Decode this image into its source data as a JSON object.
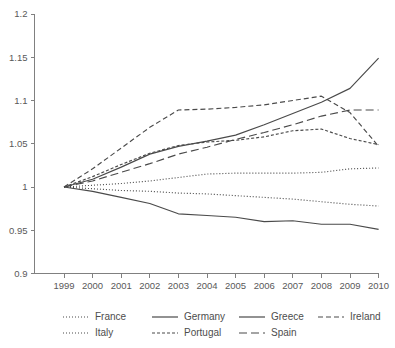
{
  "chart_data": {
    "type": "line",
    "title": "",
    "xlabel": "",
    "ylabel": "",
    "grid": false,
    "legend_position": "bottom",
    "x": [
      1999,
      2000,
      2001,
      2002,
      2003,
      2004,
      2005,
      2006,
      2007,
      2008,
      2009,
      2010
    ],
    "xtick_labels": [
      "1999",
      "2000",
      "2001",
      "2002",
      "2003",
      "2004",
      "2005",
      "2006",
      "2007",
      "2008",
      "2009",
      "2010"
    ],
    "ytick_labels": [
      "0.9",
      "0.95",
      "1",
      "1.05",
      "1.1",
      "1.15",
      "1.2"
    ],
    "ytick_values": [
      0.9,
      0.95,
      1.0,
      1.05,
      1.1,
      1.15,
      1.2
    ],
    "xlim": [
      1999,
      2010
    ],
    "ylim": [
      0.9,
      1.2
    ],
    "series": [
      {
        "name": "France",
        "style": "dotted",
        "dash": "1,2",
        "width": 1.1,
        "values": [
          1.0,
          1.002,
          1.004,
          1.007,
          1.011,
          1.015,
          1.016,
          1.016,
          1.016,
          1.017,
          1.021,
          1.022
        ]
      },
      {
        "name": "Germany",
        "style": "solid",
        "dash": "none",
        "width": 1.2,
        "values": [
          1.0,
          0.995,
          0.988,
          0.981,
          0.969,
          0.967,
          0.965,
          0.96,
          0.961,
          0.957,
          0.957,
          0.951
        ]
      },
      {
        "name": "Greece",
        "style": "solid",
        "dash": "none",
        "width": 1.05,
        "values": [
          1.0,
          1.009,
          1.023,
          1.038,
          1.047,
          1.053,
          1.06,
          1.072,
          1.085,
          1.098,
          1.114,
          1.149
        ]
      },
      {
        "name": "Ireland",
        "style": "dashed-short",
        "dash": "5,3",
        "width": 1.1,
        "values": [
          1.0,
          1.021,
          1.045,
          1.069,
          1.089,
          1.09,
          1.092,
          1.095,
          1.1,
          1.105,
          1.086,
          1.047
        ]
      },
      {
        "name": "Italy",
        "style": "dotted",
        "dash": "1,2",
        "width": 1.1,
        "values": [
          1.0,
          0.998,
          0.996,
          0.995,
          0.993,
          0.992,
          0.99,
          0.988,
          0.986,
          0.983,
          0.98,
          0.978
        ]
      },
      {
        "name": "Portugal",
        "style": "dash-dot",
        "dash": "3,2",
        "width": 1.1,
        "values": [
          1.0,
          1.012,
          1.026,
          1.039,
          1.048,
          1.052,
          1.054,
          1.058,
          1.065,
          1.067,
          1.056,
          1.049
        ]
      },
      {
        "name": "Spain",
        "style": "dashed-long",
        "dash": "8,4",
        "width": 1.2,
        "values": [
          1.0,
          1.007,
          1.017,
          1.027,
          1.038,
          1.046,
          1.055,
          1.063,
          1.072,
          1.082,
          1.089,
          1.089
        ]
      }
    ]
  },
  "legend": {
    "rows": [
      [
        {
          "label": "France",
          "dash": "1,2",
          "width": 1.1
        },
        {
          "label": "Germany",
          "dash": "none",
          "width": 1.35
        },
        {
          "label": "Greece",
          "dash": "none",
          "width": 1.0
        },
        {
          "label": "Ireland",
          "dash": "5,3",
          "width": 1.1
        }
      ],
      [
        {
          "label": "Italy",
          "dash": "1,2",
          "width": 1.1
        },
        {
          "label": "Portugal",
          "dash": "3,2",
          "width": 1.1
        },
        {
          "label": "Spain",
          "dash": "8,4",
          "width": 1.2
        }
      ]
    ]
  },
  "colors": {
    "line": "#4a4a4a",
    "axis": "#808080",
    "text": "#4d4d4d",
    "background": "#ffffff"
  }
}
